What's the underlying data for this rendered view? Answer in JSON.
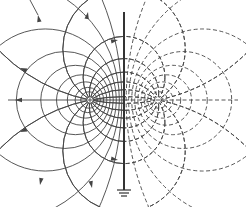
{
  "diagram": {
    "colors": {
      "background": "#ffffff",
      "line": "#444444",
      "plane": "#333333"
    },
    "real_charge": {
      "x": 90,
      "y": 100,
      "sign": "+",
      "line_style": "solid"
    },
    "image_charge": {
      "x": 158,
      "y": 100,
      "sign": "-",
      "line_style": "dashed"
    },
    "plane": {
      "x": 124,
      "y_top": 12,
      "y_bottom": 190,
      "grounded": true
    },
    "field_line_count": 16,
    "equipotential_count": 9
  }
}
